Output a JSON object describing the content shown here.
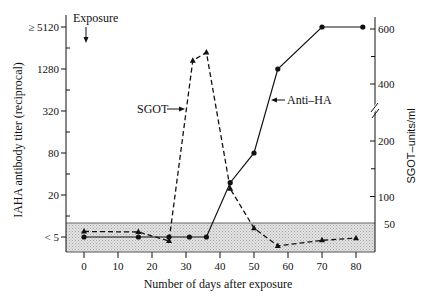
{
  "chart_data": {
    "type": "line",
    "title": "",
    "xlabel": "Number of days after exposure",
    "ylabel": "IAHA antibody titer (reciprocal)",
    "ylabel_right": "SGOT–units/ml",
    "x_axis": {
      "range": [
        0,
        80
      ],
      "ticks": [
        0,
        10,
        20,
        30,
        40,
        50,
        60,
        70,
        80
      ]
    },
    "y_axis_left": {
      "scale": "log",
      "ticks": [
        {
          "value": 5120,
          "label": "≥ 5120"
        },
        {
          "value": 1280,
          "label": "1280"
        },
        {
          "value": 320,
          "label": "320"
        },
        {
          "value": 80,
          "label": "80"
        },
        {
          "value": 20,
          "label": "20"
        },
        {
          "value": 5,
          "label": "< 5"
        }
      ],
      "minor_ticks": [
        2560,
        640,
        160,
        40,
        10
      ]
    },
    "y_axis_right": {
      "scale": "linear-with-break",
      "break_between": [
        200,
        400
      ],
      "ticks": [
        {
          "value": 600,
          "label": "600"
        },
        {
          "value": 400,
          "label": "400"
        },
        {
          "value": 200,
          "label": "200"
        },
        {
          "value": 100,
          "label": "100"
        }
      ],
      "minor_ticks": [
        500,
        150
      ],
      "extra_labels": [
        {
          "value": 50,
          "label": "50"
        }
      ]
    },
    "shaded_region": {
      "sgot_range": [
        0,
        50
      ],
      "description": "normal range band"
    },
    "series": [
      {
        "name": "Anti–HA",
        "axis": "left",
        "style": "solid",
        "marker": "circle",
        "x": [
          0,
          16,
          25,
          31,
          36,
          43,
          50,
          57,
          70,
          82
        ],
        "values": [
          5,
          5,
          5,
          5,
          5,
          30,
          80,
          1280,
          5120,
          5120
        ]
      },
      {
        "name": "SGOT",
        "axis": "right",
        "style": "dashed",
        "marker": "triangle",
        "x": [
          0,
          16,
          25,
          32,
          36,
          43,
          50,
          57,
          70,
          80
        ],
        "values": [
          37,
          36,
          20,
          485,
          515,
          114,
          43,
          11,
          21,
          25
        ]
      }
    ],
    "annotations": {
      "exposure": {
        "label": "Exposure",
        "day": 0
      },
      "sgot_label": "SGOT",
      "antiha_label": "Anti–HA"
    },
    "legend": "inline labels with arrows",
    "grid": false
  }
}
